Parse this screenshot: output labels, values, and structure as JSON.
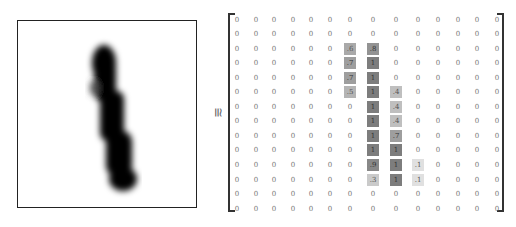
{
  "figure": {
    "approx_symbol": "≅",
    "image_description": "28x28 handwritten digit '1' rendered as a dark blurred stroke",
    "matrix": {
      "rows": 14,
      "cols": 14,
      "values": [
        [
          "0",
          "0",
          "0",
          "0",
          "0",
          "0",
          "0",
          "0",
          "0",
          "0",
          "0",
          "0",
          "0",
          "0"
        ],
        [
          "0",
          "0",
          "0",
          "0",
          "0",
          "0",
          "0",
          "0",
          "0",
          "0",
          "0",
          "0",
          "0",
          "0"
        ],
        [
          "0",
          "0",
          "0",
          "0",
          "0",
          "0",
          ".6",
          ".8",
          "0",
          "0",
          "0",
          "0",
          "0",
          "0"
        ],
        [
          "0",
          "0",
          "0",
          "0",
          "0",
          "0",
          ".7",
          "1",
          "0",
          "0",
          "0",
          "0",
          "0",
          "0"
        ],
        [
          "0",
          "0",
          "0",
          "0",
          "0",
          "0",
          ".7",
          "1",
          "0",
          "0",
          "0",
          "0",
          "0",
          "0"
        ],
        [
          "0",
          "0",
          "0",
          "0",
          "0",
          "0",
          ".5",
          "1",
          ".4",
          "0",
          "0",
          "0",
          "0",
          "0"
        ],
        [
          "0",
          "0",
          "0",
          "0",
          "0",
          "0",
          "0",
          "1",
          ".4",
          "0",
          "0",
          "0",
          "0",
          "0"
        ],
        [
          "0",
          "0",
          "0",
          "0",
          "0",
          "0",
          "0",
          "1",
          ".4",
          "0",
          "0",
          "0",
          "0",
          "0"
        ],
        [
          "0",
          "0",
          "0",
          "0",
          "0",
          "0",
          "0",
          "1",
          ".7",
          "0",
          "0",
          "0",
          "0",
          "0"
        ],
        [
          "0",
          "0",
          "0",
          "0",
          "0",
          "0",
          "0",
          "1",
          "1",
          "0",
          "0",
          "0",
          "0",
          "0"
        ],
        [
          "0",
          "0",
          "0",
          "0",
          "0",
          "0",
          "0",
          ".9",
          "1",
          ".1",
          "0",
          "0",
          "0",
          "0"
        ],
        [
          "0",
          "0",
          "0",
          "0",
          "0",
          "0",
          "0",
          ".3",
          "1",
          ".1",
          "0",
          "0",
          "0",
          "0"
        ],
        [
          "0",
          "0",
          "0",
          "0",
          "0",
          "0",
          "0",
          "0",
          "0",
          "0",
          "0",
          "0",
          "0",
          "0"
        ],
        [
          "0",
          "0",
          "0",
          "0",
          "0",
          "0",
          "0",
          "0",
          "0",
          "0",
          "0",
          "0",
          "0",
          "0"
        ]
      ],
      "col_x": [
        9,
        28,
        46,
        65,
        83,
        102,
        122,
        145,
        168,
        190,
        210,
        230,
        249,
        269
      ],
      "row_y": [
        7,
        21,
        36,
        50,
        65,
        79,
        94,
        108,
        123,
        137,
        152,
        167,
        181,
        196
      ]
    }
  }
}
